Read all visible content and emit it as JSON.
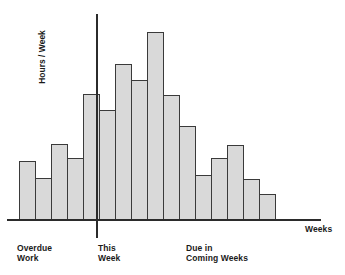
{
  "chart_data": {
    "type": "bar",
    "title": "",
    "subtitle": "",
    "xlabel": "Weeks",
    "ylabel": "Hours / Week",
    "grid": false,
    "legend": null,
    "axis_marker": {
      "name": "this-week-divider",
      "label": "This\nWeek",
      "at_category_index": 5
    },
    "region_labels": [
      {
        "name": "overdue-work",
        "label": "Overdue\nWork"
      },
      {
        "name": "this-week",
        "label": "This\nWeek"
      },
      {
        "name": "due-in-coming-weeks",
        "label": "Due in\nComing Weeks"
      }
    ],
    "categories": [
      "-5",
      "-4",
      "-3",
      "-2",
      "-1",
      "0",
      "1",
      "2",
      "3",
      "4",
      "5",
      "6",
      "7",
      "8",
      "9",
      "10"
    ],
    "values": [
      59,
      42,
      76,
      62,
      126,
      110,
      156,
      140,
      188,
      125,
      94,
      45,
      62,
      75,
      41,
      26
    ],
    "ylim": [
      0,
      206
    ],
    "xlim": [
      0,
      16
    ],
    "bar_fill": "#d9d9d9",
    "bar_stroke": "#3a3a3a",
    "axis_color": "#2b2b2b"
  }
}
